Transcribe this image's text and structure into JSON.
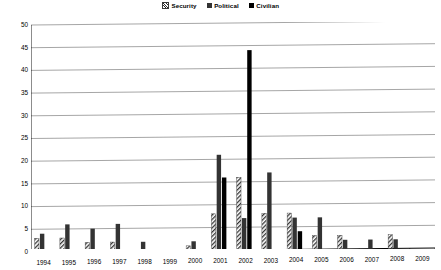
{
  "chart_data": {
    "type": "bar",
    "title": "",
    "xlabel": "",
    "ylabel": "",
    "ylim": [
      0,
      50
    ],
    "ytick_step": 5,
    "yticks": [
      "0",
      "5",
      "10",
      "15",
      "20",
      "25",
      "30",
      "35",
      "40",
      "45",
      "50"
    ],
    "grid": true,
    "legend_position": "top-center",
    "categories": [
      "1994",
      "1995",
      "1996",
      "1997",
      "1998",
      "1999",
      "2000",
      "2001",
      "2002",
      "2003",
      "2004",
      "2005",
      "2006",
      "2007",
      "2008",
      "2009"
    ],
    "series": [
      {
        "name": "Security",
        "pattern": "diagonal-hatch",
        "color": "#333333",
        "values": [
          3,
          3,
          2,
          2,
          0,
          0,
          1,
          8,
          16,
          8,
          8,
          3,
          3,
          0,
          3,
          0
        ]
      },
      {
        "name": "Political",
        "pattern": "solid",
        "color": "#333333",
        "values": [
          4,
          6,
          5,
          6,
          2,
          0,
          2,
          21,
          7,
          17,
          7,
          7,
          2,
          2,
          2,
          0
        ]
      },
      {
        "name": "Civilian",
        "pattern": "solid",
        "color": "#000000",
        "values": [
          0,
          0,
          0,
          0,
          0,
          0,
          0,
          16,
          44,
          0,
          4,
          0,
          0,
          0,
          0,
          0
        ]
      }
    ]
  },
  "legend": {
    "items": [
      {
        "label": "Security",
        "swatch": "security-swatch-icon"
      },
      {
        "label": "Political",
        "swatch": "political-swatch-icon"
      },
      {
        "label": "Civilian",
        "swatch": "civilian-swatch-icon"
      }
    ]
  },
  "colors": {
    "axis": "#000000",
    "gridline": "#808080",
    "security": "#333333",
    "political": "#333333",
    "civilian": "#000000",
    "background": "#ffffff"
  }
}
